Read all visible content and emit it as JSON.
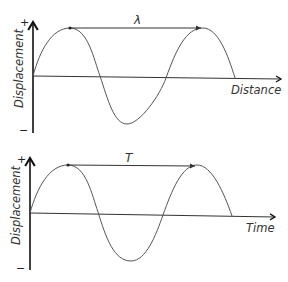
{
  "diagrams": [
    {
      "id": "wavelength",
      "y_axis_label": "Displacement",
      "y_plus": "+",
      "y_minus": "−",
      "x_axis_label": "Distance",
      "span_label": "λ",
      "span_description": "wavelength: distance between two successive crests"
    },
    {
      "id": "period",
      "y_axis_label": "Displacement",
      "y_plus": "+",
      "y_minus": "−",
      "x_axis_label": "Time",
      "span_label": "T",
      "span_description": "period: time between two successive crests"
    }
  ],
  "colors": {
    "axis": "#111111",
    "wave": "#555555",
    "text": "#333333"
  }
}
